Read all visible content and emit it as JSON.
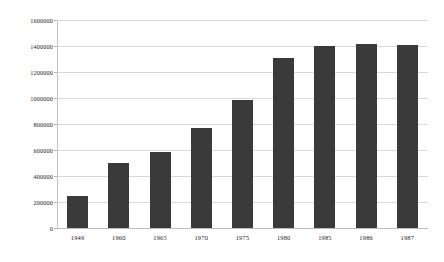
{
  "chart_data": {
    "type": "bar",
    "title": "",
    "subtitle": "",
    "xlabel": "",
    "ylabel": "",
    "categories": [
      "1949",
      "1960",
      "1965",
      "1970",
      "1975",
      "1980",
      "1985",
      "1986",
      "1987"
    ],
    "values": [
      250000,
      500000,
      585000,
      770000,
      985000,
      1305000,
      1400000,
      1415000,
      1405000
    ],
    "series": [
      {
        "name": "",
        "values": [
          250000,
          500000,
          585000,
          770000,
          985000,
          1305000,
          1400000,
          1415000,
          1405000
        ]
      }
    ],
    "ylim": [
      0,
      1600000
    ],
    "y_ticks": [
      0,
      200000,
      400000,
      600000,
      800000,
      1000000,
      1200000,
      1400000,
      1600000
    ],
    "y_tick_labels": [
      "0",
      "200000",
      "400000",
      "600000",
      "800000",
      "1000000",
      "1200000",
      "1400000",
      "1600000"
    ],
    "grid": "horizontal",
    "legend": "none",
    "bar_color": "#3a3a3a",
    "gridline_color": "#d8d8d8",
    "background_color": "#ffffff",
    "axis_color": "#bdbdbd"
  }
}
